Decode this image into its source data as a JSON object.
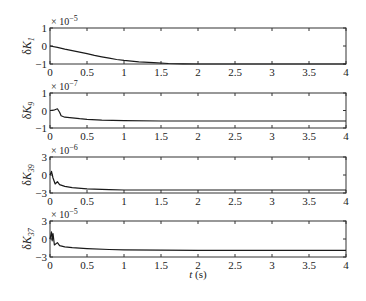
{
  "chart_data": [
    {
      "type": "line",
      "ylabel": "δK_1",
      "ylabel_main": "δK",
      "ylabel_sub": "1",
      "exponent_label": "× 10",
      "exponent": "−5",
      "ylim": [
        -1,
        1
      ],
      "yticks": [
        "1",
        "0",
        "−1"
      ],
      "xlim": [
        0,
        4
      ],
      "x": [
        0,
        0.1,
        0.2,
        0.3,
        0.4,
        0.5,
        0.6,
        0.7,
        0.8,
        0.9,
        1.0,
        1.2,
        1.4,
        1.6,
        1.8,
        2.0,
        2.5,
        3.0,
        3.5,
        4.0
      ],
      "values": [
        0.0,
        -0.08,
        -0.18,
        -0.26,
        -0.34,
        -0.43,
        -0.52,
        -0.6,
        -0.68,
        -0.75,
        -0.8,
        -0.88,
        -0.93,
        -0.97,
        -0.99,
        -1.0,
        -1.0,
        -1.0,
        -1.0,
        -1.0
      ],
      "units_scale": "1e-5"
    },
    {
      "type": "line",
      "ylabel": "δK_9",
      "ylabel_main": "δK",
      "ylabel_sub": "9",
      "exponent_label": "× 10",
      "exponent": "−7",
      "ylim": [
        -1,
        1
      ],
      "yticks": [
        "1",
        "0",
        "−1"
      ],
      "xlim": [
        0,
        4
      ],
      "x": [
        0,
        0.05,
        0.1,
        0.13,
        0.15,
        0.2,
        0.3,
        0.4,
        0.5,
        0.7,
        1.0,
        1.5,
        2.0,
        3.0,
        4.0
      ],
      "values": [
        0.0,
        0.02,
        0.1,
        -0.1,
        -0.3,
        -0.38,
        -0.42,
        -0.47,
        -0.5,
        -0.55,
        -0.58,
        -0.6,
        -0.6,
        -0.6,
        -0.6
      ],
      "units_scale": "1e-7"
    },
    {
      "type": "line",
      "ylabel": "δK_39",
      "ylabel_main": "δK",
      "ylabel_sub": "39",
      "exponent_label": "× 10",
      "exponent": "−6",
      "ylim": [
        -3,
        3
      ],
      "yticks": [
        "3",
        "0",
        "−3"
      ],
      "xlim": [
        0,
        4
      ],
      "x": [
        0,
        0.02,
        0.04,
        0.07,
        0.1,
        0.13,
        0.2,
        0.3,
        0.5,
        0.8,
        1.0,
        1.5,
        2.0,
        3.0,
        4.0
      ],
      "values": [
        0.0,
        0.6,
        -0.5,
        -1.5,
        -1.1,
        -1.6,
        -1.9,
        -2.1,
        -2.3,
        -2.45,
        -2.5,
        -2.5,
        -2.5,
        -2.5,
        -2.5
      ],
      "units_scale": "1e-6"
    },
    {
      "type": "line",
      "ylabel": "δK_37",
      "ylabel_main": "δK",
      "ylabel_sub": "37",
      "exponent_label": "× 10",
      "exponent": "−5",
      "ylim": [
        -3,
        3
      ],
      "yticks": [
        "3",
        "0",
        "−3"
      ],
      "xlim": [
        0,
        4
      ],
      "x": [
        0,
        0.02,
        0.03,
        0.04,
        0.06,
        0.1,
        0.13,
        0.2,
        0.3,
        0.5,
        0.8,
        1.0,
        1.5,
        2.0,
        3.0,
        4.0
      ],
      "values": [
        0.0,
        1.2,
        -0.3,
        0.9,
        -1.0,
        -0.6,
        -1.1,
        -1.3,
        -1.45,
        -1.6,
        -1.75,
        -1.8,
        -1.85,
        -1.9,
        -1.9,
        -1.9
      ],
      "units_scale": "1e-5"
    }
  ],
  "xaxis": {
    "ticks": [
      "0",
      "0.5",
      "1",
      "1.5",
      "2",
      "2.5",
      "3",
      "3.5",
      "4"
    ],
    "label": "t (s)",
    "label_italic": "t",
    "label_unit": " (s)"
  }
}
